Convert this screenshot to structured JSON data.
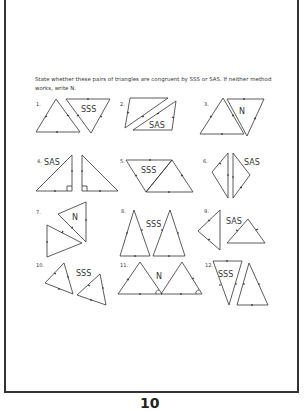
{
  "worksheet": {
    "instructions": "State whether these pairs of triangles are congruent by SSS or SAS. If neither method works, write N.",
    "page_number": "10",
    "problems": [
      {
        "number": "1.",
        "answer": "SSS"
      },
      {
        "number": "2.",
        "answer": "SAS"
      },
      {
        "number": "3.",
        "answer": "N"
      },
      {
        "number": "4.",
        "answer": "SAS"
      },
      {
        "number": "5.",
        "answer": "SSS"
      },
      {
        "number": "6.",
        "answer": "SAS"
      },
      {
        "number": "7.",
        "answer": "N"
      },
      {
        "number": "8.",
        "answer": "SSS"
      },
      {
        "number": "9.",
        "answer": "SAS"
      },
      {
        "number": "10.",
        "answer": "SSS"
      },
      {
        "number": "11.",
        "answer": "N"
      },
      {
        "number": "12.",
        "answer": "SSS"
      }
    ]
  },
  "colors": {
    "line": "#333333",
    "border": "#333333",
    "background": "#ffffff"
  }
}
